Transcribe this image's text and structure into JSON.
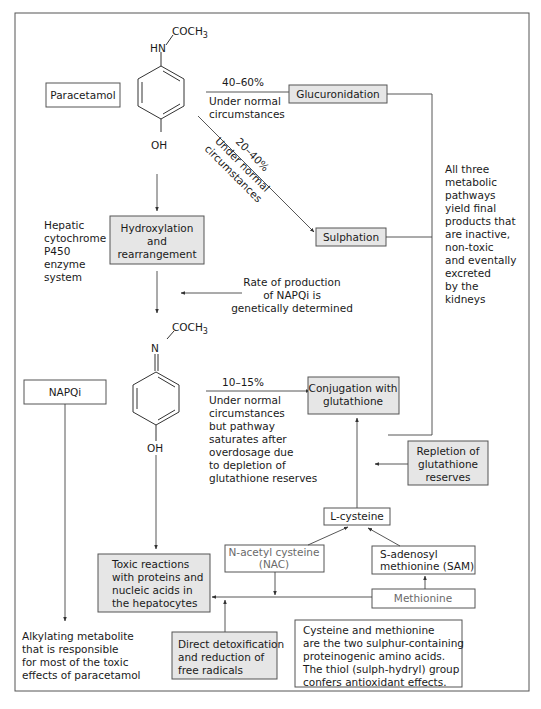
{
  "diagram": {
    "colors": {
      "shaded_box": "#e6e6e6",
      "line": "#444444",
      "frame": "#555555",
      "muted_text": "#6a6a6a"
    },
    "paracetamol": {
      "label": "Paracetamol",
      "structure": {
        "top_group": "COCH",
        "top_sub": "3",
        "amine": "HN",
        "bottom": "OH"
      }
    },
    "glucuronidation": {
      "label": "Glucuronidation",
      "percent": "40–60%",
      "condition": [
        "Under normal",
        "circumstances"
      ]
    },
    "sulphation": {
      "label": "Sulphation",
      "percent": "20–40%",
      "condition": [
        "Under normal",
        "circumstances"
      ]
    },
    "hydroxylation": {
      "label": [
        "Hydroxylation",
        "and",
        "rearrangement"
      ],
      "enzyme_note": [
        "Hepatic",
        "cytochrome",
        "P450",
        "enzyme",
        "system"
      ]
    },
    "rate_note": [
      "Rate of production",
      "of NAPQi is",
      "genetically determined"
    ],
    "pathways_note": [
      "All three",
      "metabolic",
      "pathways",
      "yield final",
      "products that",
      "are inactive,",
      "non-toxic",
      "and eventally",
      "excreted",
      "by the",
      "kidneys"
    ],
    "napqi": {
      "label": "NAPQi",
      "structure": {
        "top_group": "COCH",
        "top_sub": "3",
        "imine": "N",
        "bottom": "OH"
      },
      "description": [
        "Alkylating metabolite",
        "that is responsible",
        "for most of the toxic",
        "effects of paracetamol"
      ]
    },
    "conjugation": {
      "label": [
        "Conjugation with",
        "glutathione"
      ],
      "percent": "10–15%",
      "condition": [
        "Under normal",
        "circumstances",
        "but pathway",
        "saturates after",
        "overdosage due",
        "to depletion of",
        "glutathione reserves"
      ]
    },
    "repletion": {
      "label": [
        "Repletion of",
        "glutathione",
        "reserves"
      ]
    },
    "l_cysteine": {
      "label": "L-cysteine"
    },
    "nac": {
      "label": [
        "N-acetyl cysteine",
        "(NAC)"
      ]
    },
    "sam": {
      "label": [
        "S-adenosyl",
        "methionine (SAM)"
      ]
    },
    "methionine": {
      "label": "Methionine"
    },
    "toxic": {
      "label": [
        "Toxic reactions",
        "with proteins and",
        "nucleic acids in",
        "the hepatocytes"
      ]
    },
    "detox": {
      "label": [
        "Direct detoxification",
        "and reduction of",
        "free radicals"
      ]
    },
    "amino_note": {
      "label": [
        "Cysteine and methionine",
        "are the two sulphur-containing",
        "proteinogenic amino acids.",
        "The thiol (sulph-hydryl) group",
        "confers antioxidant effects."
      ]
    }
  }
}
